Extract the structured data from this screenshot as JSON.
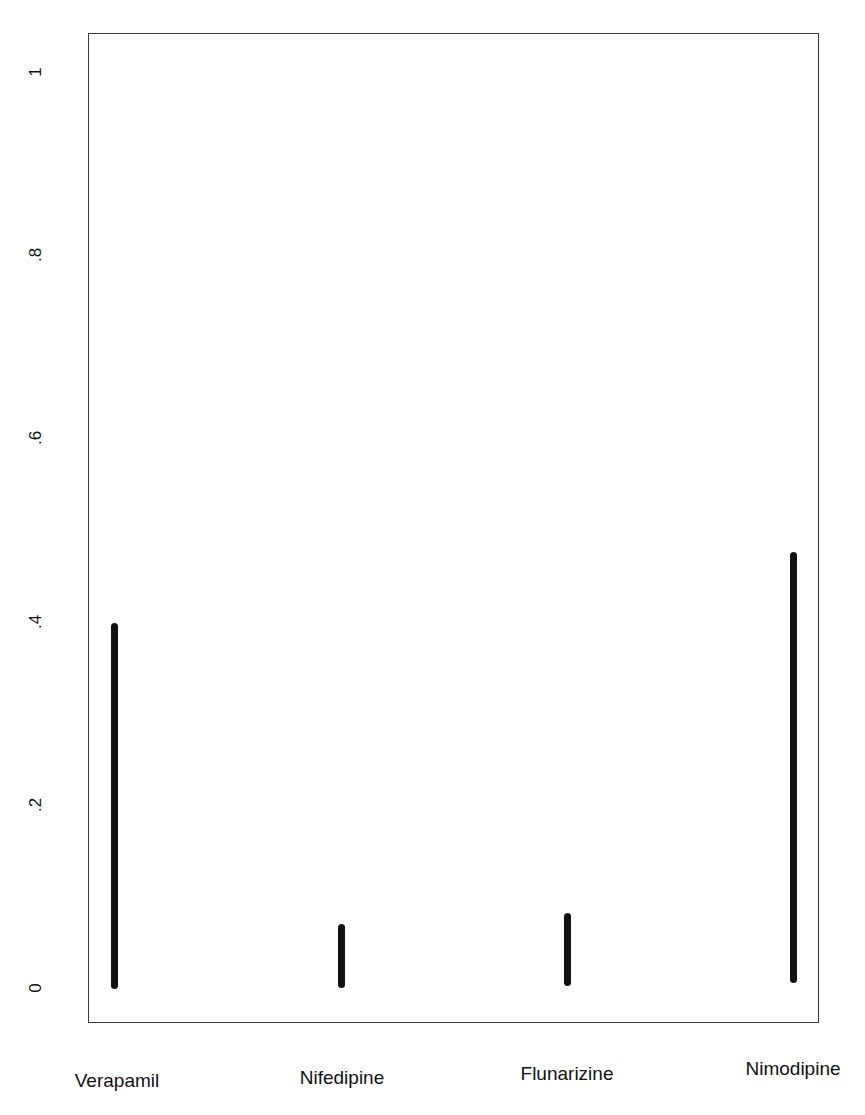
{
  "chart_data": {
    "type": "bar",
    "style": "needle",
    "title": "",
    "xlabel": "",
    "ylabel": "",
    "categories": [
      "Verapamil",
      "Nifedipine",
      "Flunarizine",
      "Nimodipine"
    ],
    "values": [
      0.4,
      0.07,
      0.08,
      0.47
    ],
    "ylim": [
      0,
      1
    ],
    "yticks": [
      0,
      0.2,
      0.4,
      0.6,
      0.8,
      1
    ],
    "ytick_labels": [
      "0",
      ".2",
      ".4",
      ".6",
      ".8",
      "1"
    ],
    "grid": false,
    "legend": null,
    "bar_color": "#111111"
  },
  "axis": {
    "y_labels": [
      "0",
      ".2",
      ".4",
      ".6",
      ".8",
      "1"
    ]
  },
  "bars": [
    {
      "label": "Verapamil",
      "value": 0.4
    },
    {
      "label": "Nifedipine",
      "value": 0.07
    },
    {
      "label": "Flunarizine",
      "value": 0.08
    },
    {
      "label": "Nimodipine",
      "value": 0.47
    }
  ]
}
